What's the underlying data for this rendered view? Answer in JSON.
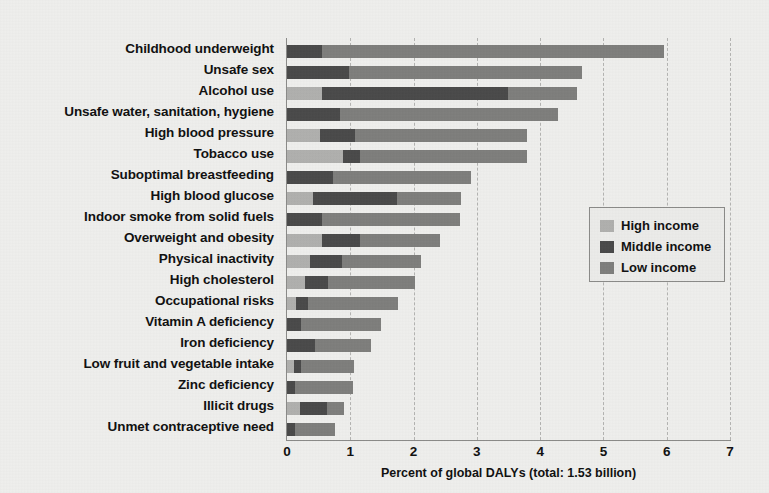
{
  "chart_data": {
    "type": "bar",
    "orientation": "horizontal",
    "stacked": true,
    "title": "",
    "xlabel": "Percent of global DALYs (total: 1.53 billion)",
    "ylabel": "",
    "xlim": [
      0,
      7
    ],
    "xticks": [
      0,
      1,
      2,
      3,
      4,
      5,
      6,
      7
    ],
    "grid": "vertical-dashed",
    "legend_position": "center-right",
    "categories": [
      "Childhood underweight",
      "Unsafe sex",
      "Alcohol use",
      "Unsafe water, sanitation, hygiene",
      "High blood pressure",
      "Tobacco use",
      "Suboptimal breastfeeding",
      "High blood glucose",
      "Indoor smoke from solid fuels",
      "Overweight and obesity",
      "Physical inactivity",
      "High cholesterol",
      "Occupational risks",
      "Vitamin A deficiency",
      "Iron deficiency",
      "Low fruit and vegetable intake",
      "Zinc deficiency",
      "Illicit drugs",
      "Unmet contraceptive need"
    ],
    "series": [
      {
        "name": "High income",
        "color": "#b0b0ae",
        "values": [
          0.0,
          0.0,
          0.55,
          0.0,
          0.52,
          0.89,
          0.0,
          0.41,
          0.0,
          0.55,
          0.36,
          0.28,
          0.15,
          0.0,
          0.0,
          0.11,
          0.0,
          0.2,
          0.0
        ]
      },
      {
        "name": "Middle income",
        "color": "#4a4a4a",
        "values": [
          0.55,
          0.98,
          2.94,
          0.84,
          0.55,
          0.26,
          0.73,
          1.33,
          0.55,
          0.6,
          0.51,
          0.37,
          0.18,
          0.22,
          0.44,
          0.11,
          0.13,
          0.43,
          0.13
        ]
      },
      {
        "name": "Low income",
        "color": "#7e7e7c",
        "values": [
          5.4,
          3.68,
          1.09,
          3.44,
          2.72,
          2.64,
          2.17,
          1.01,
          2.18,
          1.27,
          1.25,
          1.37,
          1.42,
          1.26,
          0.89,
          0.84,
          0.91,
          0.27,
          0.63
        ]
      }
    ],
    "totals": [
      5.95,
      4.66,
      4.58,
      4.28,
      3.79,
      3.79,
      2.9,
      2.75,
      2.73,
      2.42,
      2.12,
      2.02,
      1.75,
      1.48,
      1.33,
      1.06,
      1.04,
      0.9,
      0.76
    ]
  },
  "legend": {
    "items": [
      {
        "label": "High income",
        "color": "#b0b0ae"
      },
      {
        "label": "Middle income",
        "color": "#4a4a4a"
      },
      {
        "label": "Low income",
        "color": "#7e7e7c"
      }
    ]
  },
  "colors": {
    "background": "#eeeeec",
    "axis": "#8a8a88",
    "grid": "#b4b4b2",
    "text": "#111111"
  }
}
